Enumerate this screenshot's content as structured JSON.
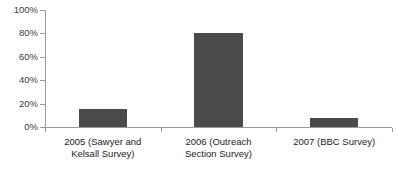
{
  "chart_data": {
    "type": "bar",
    "title": "",
    "subtitle": "",
    "xlabel": "",
    "ylabel": "",
    "categories": [
      "2005 (Sawyer and\nKelsall Survey)",
      "2006 (Outreach\nSection Survey)",
      "2007 (BBC Survey)"
    ],
    "values": [
      15,
      80,
      8
    ],
    "ylim": [
      0,
      100
    ],
    "ytick_labels": [
      "100%",
      "80%",
      "60%",
      "40%",
      "20%",
      "0%"
    ],
    "ytick_values": [
      100,
      80,
      60,
      40,
      20,
      0
    ],
    "grid": false,
    "legend": false,
    "legend_position": "none",
    "bar_color": "#4a4a4a",
    "axis_color": "#9a9a9a",
    "background_color": "#ffffff",
    "value_suffix": "%"
  }
}
